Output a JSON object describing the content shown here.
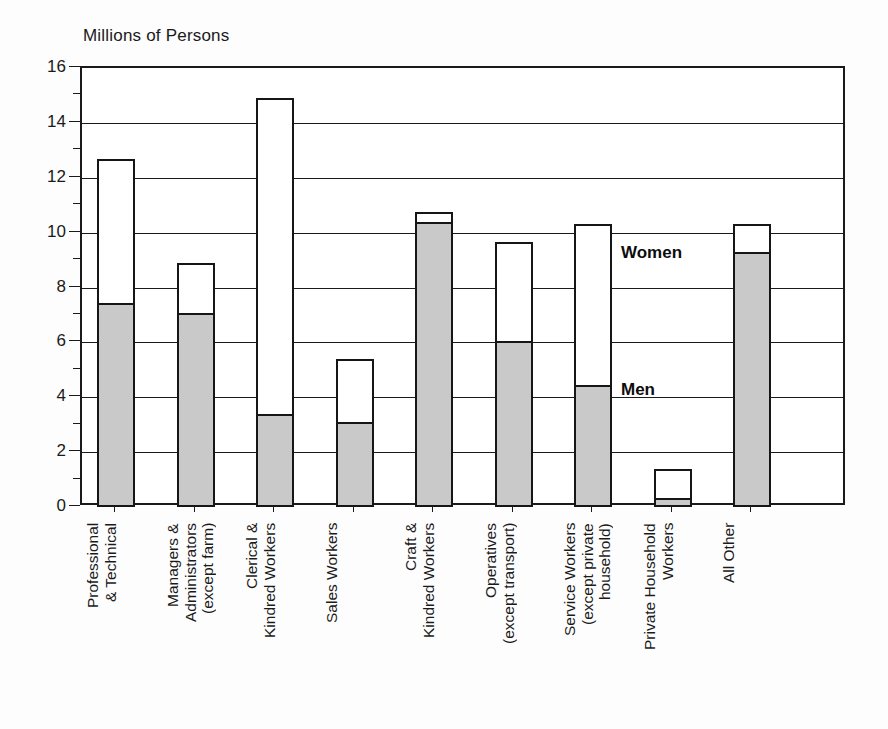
{
  "chart_data": {
    "type": "bar",
    "subtype": "stacked",
    "title": "Millions of Persons",
    "xlabel": "",
    "ylabel": "Millions of Persons",
    "ylim": [
      0,
      16
    ],
    "ytick_step": 2,
    "ytick_labels": [
      "0",
      "2",
      "4",
      "6",
      "8",
      "10",
      "12",
      "14",
      "16"
    ],
    "yticks": [
      0,
      2,
      4,
      6,
      8,
      10,
      12,
      14,
      16
    ],
    "grid": true,
    "legend_position": "inside-plot",
    "categories": [
      "Professional\n& Technical",
      "Managers &\nAdministrators\n(except farm)",
      "Clerical &\nKindred Workers",
      "Sales Workers",
      "Craft &\nKindred Workers",
      "Operatives\n(except transport)",
      "Service Workers\n(except private\nhousehold)",
      "Private Household\nWorkers",
      "All Other"
    ],
    "series": [
      {
        "name": "Men",
        "color": "#c9c9c9",
        "values": [
          7.45,
          7.1,
          3.4,
          3.1,
          10.4,
          6.05,
          4.45,
          0.35,
          9.3
        ]
      },
      {
        "name": "Women",
        "color": "#ffffff",
        "values": [
          5.25,
          1.8,
          11.5,
          2.3,
          0.35,
          3.6,
          5.85,
          1.05,
          1.0
        ]
      }
    ],
    "totals": [
      12.7,
      8.9,
      14.9,
      5.4,
      10.75,
      9.65,
      10.3,
      1.4,
      10.3
    ],
    "annotations": [
      {
        "label": "Men",
        "value": 4.3,
        "category_index": 6
      },
      {
        "label": "Women",
        "value": 9.3,
        "category_index": 6
      }
    ]
  },
  "colors": {
    "men_fill": "#c9c9c9",
    "women_fill": "#ffffff",
    "outline": "#161616",
    "axis": "#1a1a1a",
    "background": "#fdfdfd"
  }
}
